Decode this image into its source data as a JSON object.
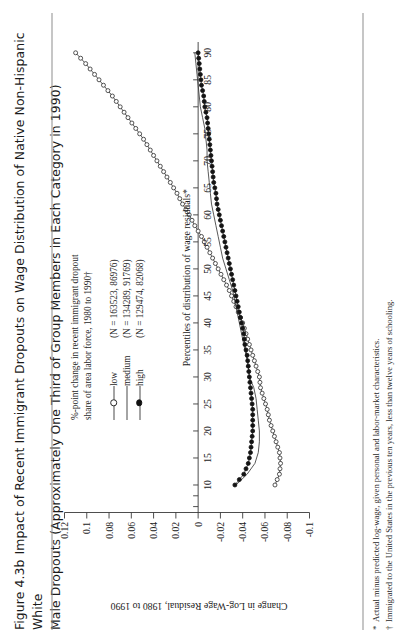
{
  "figure": {
    "number": "Figure 4.3b",
    "title_line1": "Impact of Recent Immigrant Dropouts on Wage Distribution of Native Non-Hispanic White",
    "title_line2": "Male Dropouts (Approximately One Third of Group Members in Each Category in 1990)"
  },
  "footnotes": [
    {
      "marker": "*",
      "text": "Actual minus predicted log-wage, given personal and labor-market characteristics."
    },
    {
      "marker": "†",
      "text": "Immigrated to the United States in the previous ten years, less than twelve years of schooling."
    }
  ],
  "legend": {
    "head_line1": "%-point change in recent immigrant dropout",
    "head_line2": "share of area labor force, 1980 to 1990†",
    "entries": [
      {
        "name": "low",
        "n": "(N = 163523, 86976)",
        "marker": "open-circle-marker"
      },
      {
        "name": "medium",
        "n": "(N = 134289, 91769)",
        "marker": "line-only-marker"
      },
      {
        "name": "high",
        "n": "(N = 129474, 82068)",
        "marker": "filled-circle-marker"
      }
    ]
  },
  "chart_data": {
    "type": "line",
    "title": "Impact of Recent Immigrant Dropouts on Wage Distribution of Native Non-Hispanic White Male Dropouts (Approximately One Third of Group Members in Each Category in 1990)",
    "xlabel": "Percentiles of distribution of wage residuals*",
    "ylabel": "Change in Log-Wage Residual, 1980 to 1990",
    "xlim": [
      5,
      92
    ],
    "ylim": [
      -0.1,
      0.12
    ],
    "xticks": [
      10,
      15,
      20,
      25,
      30,
      35,
      40,
      45,
      50,
      55,
      60,
      65,
      70,
      75,
      80,
      85,
      90
    ],
    "xtick_labels": [
      "10",
      "15",
      "20",
      "25",
      "30",
      "35",
      "40",
      "45",
      "50",
      "55",
      "60",
      "65",
      "70",
      "75",
      "80",
      "85",
      "90"
    ],
    "yticks": [
      -0.1,
      -0.08,
      -0.06,
      -0.04,
      -0.02,
      0,
      0.02,
      0.04,
      0.06,
      0.08,
      0.1,
      0.12
    ],
    "ytick_labels": [
      "-0.1",
      "-0.08",
      "-0.06",
      "-0.04",
      "-0.02",
      "0",
      "0.02",
      "0.04",
      "0.06",
      "0.08",
      "0.1",
      "0.12"
    ],
    "grid": false,
    "legend_position": "upper-left-inside",
    "x": [
      10,
      12,
      14,
      16,
      18,
      20,
      22,
      24,
      26,
      28,
      30,
      32,
      34,
      36,
      38,
      40,
      42,
      44,
      46,
      48,
      50,
      52,
      54,
      56,
      58,
      60,
      62,
      64,
      66,
      68,
      70,
      72,
      74,
      76,
      78,
      80,
      82,
      84,
      86,
      88,
      90
    ],
    "series": [
      {
        "name": "low",
        "marker": "open-circle",
        "values": [
          -0.069,
          -0.073,
          -0.074,
          -0.073,
          -0.07,
          -0.067,
          -0.064,
          -0.062,
          -0.059,
          -0.056,
          -0.055,
          -0.052,
          -0.049,
          -0.046,
          -0.043,
          -0.04,
          -0.036,
          -0.032,
          -0.028,
          -0.023,
          -0.018,
          -0.013,
          -0.008,
          -0.003,
          0.003,
          0.008,
          0.014,
          0.019,
          0.025,
          0.031,
          0.037,
          0.043,
          0.049,
          0.056,
          0.063,
          0.07,
          0.077,
          0.085,
          0.093,
          0.101,
          0.11
        ]
      },
      {
        "name": "medium",
        "marker": "none",
        "values": [
          -0.034,
          -0.044,
          -0.051,
          -0.054,
          -0.055,
          -0.055,
          -0.054,
          -0.053,
          -0.052,
          -0.05,
          -0.046,
          -0.045,
          -0.043,
          -0.041,
          -0.039,
          -0.037,
          -0.035,
          -0.033,
          -0.031,
          -0.028,
          -0.025,
          -0.022,
          -0.02,
          -0.018,
          -0.016,
          -0.014,
          -0.012,
          -0.011,
          -0.01,
          -0.009,
          -0.008,
          -0.008,
          -0.007,
          -0.006,
          -0.004,
          -0.002,
          -0.001,
          0.0,
          0.001,
          0.002,
          0.003
        ]
      },
      {
        "name": "high",
        "marker": "filled-circle",
        "values": [
          -0.033,
          -0.041,
          -0.045,
          -0.047,
          -0.048,
          -0.049,
          -0.049,
          -0.049,
          -0.048,
          -0.047,
          -0.046,
          -0.045,
          -0.044,
          -0.042,
          -0.041,
          -0.039,
          -0.037,
          -0.035,
          -0.033,
          -0.031,
          -0.029,
          -0.027,
          -0.025,
          -0.023,
          -0.021,
          -0.019,
          -0.017,
          -0.016,
          -0.014,
          -0.013,
          -0.012,
          -0.011,
          -0.01,
          -0.009,
          -0.008,
          -0.006,
          -0.005,
          -0.003,
          -0.002,
          -0.001,
          0.0
        ]
      }
    ]
  }
}
